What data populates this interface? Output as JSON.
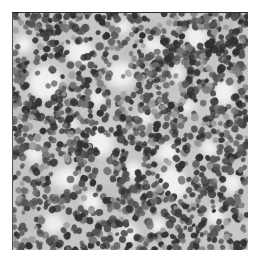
{
  "page": {
    "background_color": "#ffffff",
    "width": 265,
    "height": 261
  },
  "figure": {
    "name": "histopathology-micrograph",
    "modality": "light microscopy",
    "stain_appearance": "grayscale",
    "tissue_description": "densely packed small round dark nuclei with scattered pale clearings",
    "border_color": "#2b2b2b",
    "frame": {
      "x": 12,
      "y": 12,
      "width": 236,
      "height": 238
    },
    "palette": {
      "background_tissue": "#c9c9c9",
      "light_clearing": "#f4f4f4",
      "mid_tone": "#9a9a9a",
      "nucleus_dark": "#2a2a2a",
      "nucleus_mid": "#4e4e4e",
      "nucleus_light": "#6f6f6f"
    },
    "texture": {
      "nucleus_count": 1500,
      "nucleus_min_radius": 2.1,
      "nucleus_max_radius": 4.0,
      "clearing_count": 26,
      "clearing_min_radius": 6,
      "clearing_max_radius": 19,
      "seed": 20240517
    },
    "clearings": [
      {
        "cx": 0.13,
        "cy": 0.3,
        "r": 0.055
      },
      {
        "cx": 0.28,
        "cy": 0.17,
        "r": 0.04
      },
      {
        "cx": 0.09,
        "cy": 0.6,
        "r": 0.035
      },
      {
        "cx": 0.22,
        "cy": 0.7,
        "r": 0.048
      },
      {
        "cx": 0.18,
        "cy": 0.88,
        "r": 0.04
      },
      {
        "cx": 0.36,
        "cy": 0.36,
        "r": 0.03
      },
      {
        "cx": 0.45,
        "cy": 0.27,
        "r": 0.048
      },
      {
        "cx": 0.38,
        "cy": 0.55,
        "r": 0.044
      },
      {
        "cx": 0.33,
        "cy": 0.8,
        "r": 0.034
      },
      {
        "cx": 0.52,
        "cy": 0.66,
        "r": 0.03
      },
      {
        "cx": 0.49,
        "cy": 0.93,
        "r": 0.03
      },
      {
        "cx": 0.6,
        "cy": 0.13,
        "r": 0.034
      },
      {
        "cx": 0.57,
        "cy": 0.44,
        "r": 0.026
      },
      {
        "cx": 0.66,
        "cy": 0.58,
        "r": 0.036
      },
      {
        "cx": 0.7,
        "cy": 0.25,
        "r": 0.03
      },
      {
        "cx": 0.78,
        "cy": 0.1,
        "r": 0.036
      },
      {
        "cx": 0.74,
        "cy": 0.4,
        "r": 0.026
      },
      {
        "cx": 0.68,
        "cy": 0.71,
        "r": 0.044
      },
      {
        "cx": 0.83,
        "cy": 0.57,
        "r": 0.03
      },
      {
        "cx": 0.9,
        "cy": 0.33,
        "r": 0.038
      },
      {
        "cx": 0.93,
        "cy": 0.72,
        "r": 0.034
      },
      {
        "cx": 0.86,
        "cy": 0.86,
        "r": 0.03
      },
      {
        "cx": 0.05,
        "cy": 0.13,
        "r": 0.026
      },
      {
        "cx": 0.47,
        "cy": 0.06,
        "r": 0.024
      },
      {
        "cx": 0.26,
        "cy": 0.47,
        "r": 0.024
      },
      {
        "cx": 0.62,
        "cy": 0.89,
        "r": 0.026
      }
    ]
  }
}
